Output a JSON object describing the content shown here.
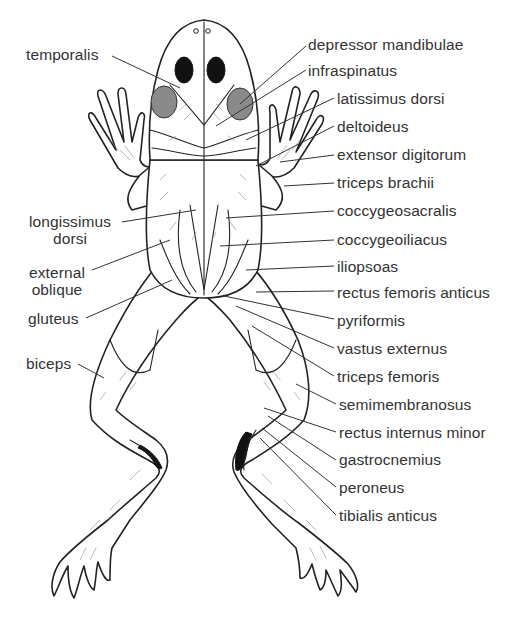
{
  "figure": {
    "labels_left": [
      {
        "id": "temporalis",
        "text": "temporalis"
      },
      {
        "id": "longissimus-dorsi",
        "text": "longissimus dorsi",
        "lines": [
          "longissimus",
          "dorsi"
        ]
      },
      {
        "id": "external-oblique",
        "text": "external oblique",
        "lines": [
          "external",
          "oblique"
        ]
      },
      {
        "id": "gluteus",
        "text": "gluteus"
      },
      {
        "id": "biceps",
        "text": "biceps"
      }
    ],
    "labels_right": [
      {
        "id": "depressor-mandibulae",
        "text": "depressor mandibulae"
      },
      {
        "id": "infraspinatus",
        "text": "infraspinatus"
      },
      {
        "id": "latissimus-dorsi",
        "text": "latissimus dorsi"
      },
      {
        "id": "deltoideus",
        "text": "deltoideus"
      },
      {
        "id": "extensor-digitorum",
        "text": "extensor digitorum"
      },
      {
        "id": "triceps-brachii",
        "text": "triceps brachii"
      },
      {
        "id": "coccygeosacralis",
        "text": "coccygeosacralis"
      },
      {
        "id": "coccygeoiliacus",
        "text": "coccygeoiliacus"
      },
      {
        "id": "iliopsoas",
        "text": "iliopsoas"
      },
      {
        "id": "rectus-femoris-anticus",
        "text": "rectus femoris anticus"
      },
      {
        "id": "pyriformis",
        "text": "pyriformis"
      },
      {
        "id": "vastus-externus",
        "text": "vastus externus"
      },
      {
        "id": "triceps-femoris",
        "text": "triceps femoris"
      },
      {
        "id": "semimembranosus",
        "text": "semimembranosus"
      },
      {
        "id": "rectus-internus-minor",
        "text": "rectus internus minor"
      },
      {
        "id": "gastrocnemius",
        "text": "gastrocnemius"
      },
      {
        "id": "peroneus",
        "text": "peroneus"
      },
      {
        "id": "tibialis-anticus",
        "text": "tibialis anticus"
      }
    ]
  }
}
